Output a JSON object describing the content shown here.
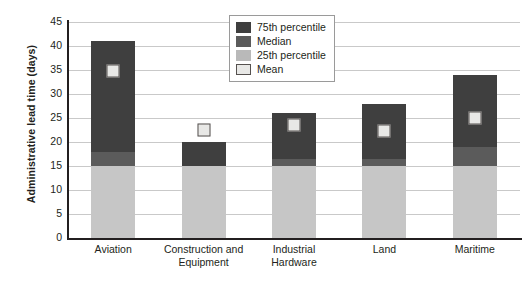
{
  "chart_data": {
    "type": "bar",
    "title": "",
    "xlabel": "",
    "ylabel": "Administrative lead time (days)",
    "ylim": [
      0,
      45
    ],
    "ytick_step": 5,
    "yticks": [
      45,
      40,
      35,
      30,
      25,
      20,
      15,
      10,
      5,
      0
    ],
    "grid": true,
    "legend_position": "top-center",
    "categories": [
      "Aviation",
      "Construction and Equipment",
      "Industrial Hardware",
      "Land",
      "Maritime"
    ],
    "series": [
      {
        "name": "25th percentile",
        "values": [
          15,
          15,
          15,
          15,
          15
        ]
      },
      {
        "name": "Median",
        "values": [
          18,
          15,
          16.5,
          16.5,
          19
        ]
      },
      {
        "name": "75th percentile",
        "values": [
          41,
          20,
          26,
          28,
          34
        ]
      },
      {
        "name": "Mean",
        "values": [
          34.7,
          22.5,
          23.5,
          22.2,
          25
        ]
      }
    ],
    "legend": [
      {
        "key": "p75",
        "label": "75th percentile",
        "color": "#3f3f3f"
      },
      {
        "key": "med",
        "label": "Median",
        "color": "#5b5b5b"
      },
      {
        "key": "p25",
        "label": "25th percentile",
        "color": "#b9b9b9"
      },
      {
        "key": "mean",
        "label": "Mean",
        "color": "#e8e8e6"
      }
    ]
  },
  "caption": ""
}
